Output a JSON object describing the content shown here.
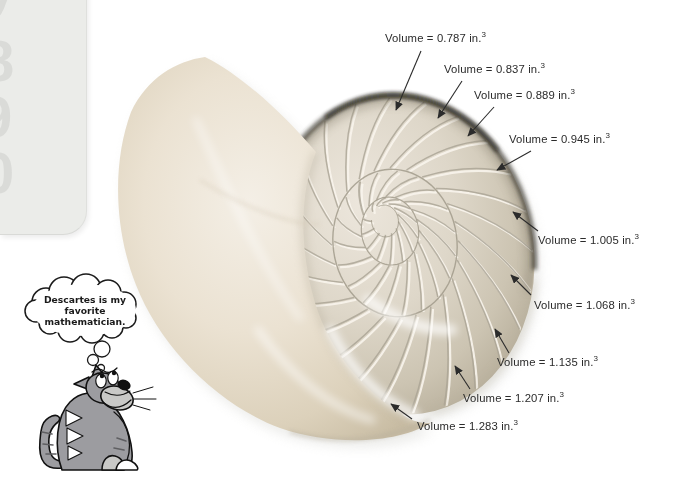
{
  "figure": {
    "annotation_prefix": "Volume",
    "unit": "in.",
    "exponent": "3",
    "chambers": [
      {
        "volume": 0.787,
        "label_x": 385,
        "label_y": 32,
        "arrow": [
          421,
          51,
          396,
          110
        ]
      },
      {
        "volume": 0.837,
        "label_x": 444,
        "label_y": 63,
        "arrow": [
          462,
          81,
          438,
          118
        ]
      },
      {
        "volume": 0.889,
        "label_x": 474,
        "label_y": 89,
        "arrow": [
          494,
          107,
          468,
          136
        ]
      },
      {
        "volume": 0.945,
        "label_x": 509,
        "label_y": 133,
        "arrow": [
          531,
          151,
          497,
          170
        ]
      },
      {
        "volume": 1.005,
        "label_x": 538,
        "label_y": 234,
        "arrow": [
          538,
          231,
          513,
          212
        ]
      },
      {
        "volume": 1.068,
        "label_x": 534,
        "label_y": 299,
        "arrow": [
          531,
          295,
          511,
          275
        ]
      },
      {
        "volume": 1.135,
        "label_x": 497,
        "label_y": 356,
        "arrow": [
          509,
          353,
          495,
          329
        ]
      },
      {
        "volume": 1.207,
        "label_x": 463,
        "label_y": 392,
        "arrow": [
          470,
          389,
          455,
          366
        ]
      },
      {
        "volume": 1.283,
        "label_x": 417,
        "label_y": 420,
        "arrow": [
          412,
          419,
          391,
          404
        ]
      }
    ]
  },
  "cat": {
    "description": "cartoon-cat-looking-up",
    "bubble_lines": [
      "Descartes is my",
      "favorite",
      "mathematician."
    ]
  },
  "page_edge": {
    "ghost_glyphs": [
      "y",
      "8",
      "9",
      "0"
    ]
  },
  "colors": {
    "label_text": "#2b2b2b",
    "arrow": "#2b2b2b",
    "shell_body": "#ebe2d2",
    "shell_chambers": "#dfd8cb",
    "shell_rim_dark": "#2e2a24",
    "cat_gray": "#9c9ca0",
    "page_edge_gray": "#ebece9"
  }
}
